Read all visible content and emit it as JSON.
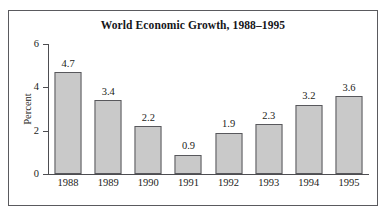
{
  "chart_data": {
    "type": "bar",
    "title": "World Economic Growth, 1988–1995",
    "xlabel": "",
    "ylabel": "Percent",
    "categories": [
      "1988",
      "1989",
      "1990",
      "1991",
      "1992",
      "1993",
      "1994",
      "1995"
    ],
    "values": [
      4.7,
      3.4,
      2.2,
      0.9,
      1.9,
      2.3,
      3.2,
      3.6
    ],
    "value_labels": [
      "4.7",
      "3.4",
      "2.2",
      "0.9",
      "1.9",
      "2.3",
      "3.2",
      "3.6"
    ],
    "ylim": [
      0,
      6
    ],
    "ytick_labels": [
      "0",
      "2",
      "4",
      "6"
    ],
    "ytick_values": [
      0,
      2,
      4,
      6
    ],
    "grid": false,
    "legend": null,
    "colors": {
      "bar_fill": "#c9c9c9",
      "bar_border": "#58585c",
      "axis": "#4d4d51",
      "text": "#1c1c20",
      "frame": "#5a5a5e",
      "background": "#ffffff"
    }
  }
}
